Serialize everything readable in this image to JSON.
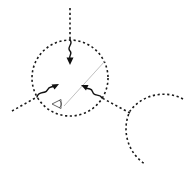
{
  "diagram": {
    "type": "scattering-geometry-schematic",
    "background": "#ffffff",
    "stroke_color": "#1a1a1a",
    "divider_color": "#b0b0b0",
    "elements": {
      "main_circle": {
        "shape": "dashed-circle",
        "cx": 70,
        "cy": 78,
        "r": 38
      },
      "secondary_arc": {
        "shape": "dashed-arc",
        "cx": 170,
        "cy": 132,
        "r": 42
      },
      "dividing_line": {
        "shape": "thin-line",
        "x1": 105,
        "y1": 61,
        "x2": 64,
        "y2": 106
      },
      "incoming_paths": [
        {
          "id": "top",
          "dashed_from": [
            70,
            8
          ],
          "dashed_to": [
            70,
            40
          ],
          "arrow_to": [
            70,
            64
          ]
        },
        {
          "id": "left",
          "dashed_from": [
            12,
            111
          ],
          "dashed_to": [
            37,
            97
          ],
          "arrow_to": [
            58,
            84
          ]
        },
        {
          "id": "right",
          "dashed_from": [
            130,
            113
          ],
          "dashed_to": [
            102,
            98
          ],
          "arrow_to": [
            82,
            85
          ]
        }
      ],
      "observer_icon": {
        "symbol": "eye",
        "x": 57,
        "y": 104
      }
    }
  }
}
